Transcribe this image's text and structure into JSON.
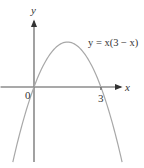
{
  "chart_data": {
    "type": "line",
    "title": "",
    "equation_label": "y = x(3 − x)",
    "xlabel": "x",
    "ylabel": "y",
    "x_tick_labels": [
      {
        "value": 0,
        "label": "0"
      },
      {
        "value": 3,
        "label": "3"
      }
    ],
    "xlim": [
      -1.5,
      4.9
    ],
    "ylim": [
      -3.75,
      4.3
    ],
    "grid": false,
    "series": [
      {
        "name": "y = x(3 − x)",
        "function": "x*(3-x)",
        "x": [
          -0.95,
          -0.5,
          0,
          0.5,
          1,
          1.5,
          2,
          2.5,
          3,
          3.5,
          3.95
        ],
        "y": [
          -3.75,
          -1.75,
          0,
          1.25,
          2,
          2.25,
          2,
          1.25,
          0,
          -1.75,
          -3.75
        ]
      }
    ]
  }
}
